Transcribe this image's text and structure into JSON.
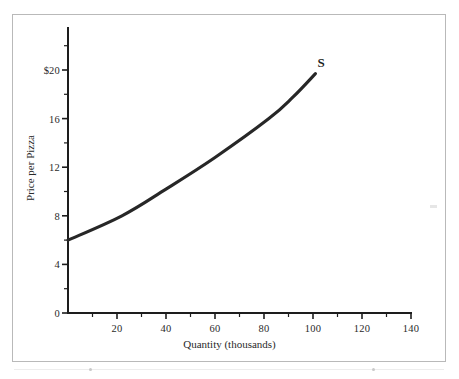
{
  "chart_data": {
    "type": "line",
    "title": "",
    "subtitle": "",
    "xlabel": "Quantity (thousands)",
    "ylabel": "Price per Pizza",
    "xlim": [
      0,
      140
    ],
    "ylim": [
      0,
      24
    ],
    "grid": false,
    "legend_position": "inline-curve-end",
    "x_ticks_major": [
      20,
      40,
      60,
      80,
      100,
      120,
      140
    ],
    "x_tick_labels": [
      "20",
      "40",
      "60",
      "80",
      "100",
      "120",
      "140"
    ],
    "x_ticks_minor": [
      10,
      30,
      50,
      70,
      90,
      110,
      130
    ],
    "y_ticks_major": [
      0,
      4,
      8,
      12,
      16,
      20
    ],
    "y_tick_labels": [
      "0",
      "4",
      "8",
      "12",
      "16",
      "$20"
    ],
    "y_ticks_minor": [
      2,
      6,
      10,
      14,
      18,
      22
    ],
    "series": [
      {
        "name": "S",
        "label": "S",
        "color": "#272727",
        "annotation": "S",
        "points": [
          {
            "x": 0,
            "y": 6.0
          },
          {
            "x": 22,
            "y": 8.0
          },
          {
            "x": 40,
            "y": 10.2
          },
          {
            "x": 60,
            "y": 12.8
          },
          {
            "x": 82,
            "y": 16.0
          },
          {
            "x": 92,
            "y": 17.8
          },
          {
            "x": 101,
            "y": 19.7
          }
        ]
      }
    ]
  },
  "figure": {
    "x_axis_title": "Quantity (thousands)",
    "y_axis_title": "Price per Pizza",
    "curve_label": "S"
  },
  "colors": {
    "curve": "#272727",
    "axis": "#1d1d1d",
    "frame": "#b9b9b9",
    "text": "#2a2a2a",
    "background": "#ffffff"
  }
}
